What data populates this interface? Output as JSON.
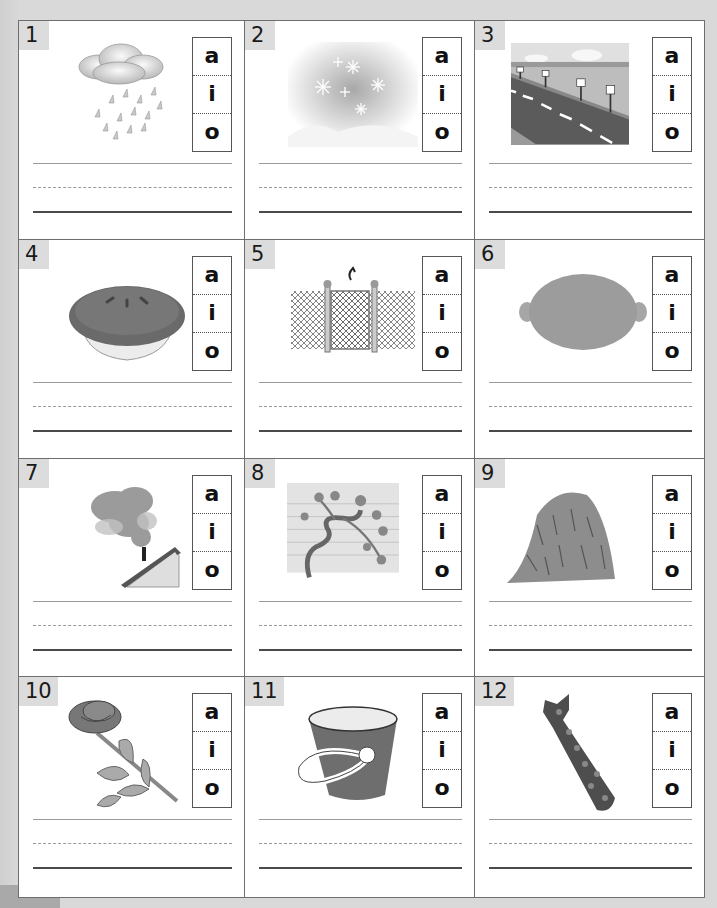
{
  "worksheet": {
    "vowel_choices": [
      "a",
      "i",
      "o"
    ],
    "items": [
      {
        "number": "1",
        "picture": "rain-icon"
      },
      {
        "number": "2",
        "picture": "snow-icon"
      },
      {
        "number": "3",
        "picture": "road-icon"
      },
      {
        "number": "4",
        "picture": "pie-icon"
      },
      {
        "number": "5",
        "picture": "gate-icon"
      },
      {
        "number": "6",
        "picture": "lemon-icon"
      },
      {
        "number": "7",
        "picture": "smoke-icon"
      },
      {
        "number": "8",
        "picture": "vine-icon"
      },
      {
        "number": "9",
        "picture": "hay-icon"
      },
      {
        "number": "10",
        "picture": "rose-icon"
      },
      {
        "number": "11",
        "picture": "pail-icon"
      },
      {
        "number": "12",
        "picture": "tie-icon"
      }
    ]
  },
  "colors": {
    "background": "#d9d9d9",
    "cell_border": "#6e6e6e",
    "number_tab": "#dcdcdc",
    "ink": "#111111"
  }
}
